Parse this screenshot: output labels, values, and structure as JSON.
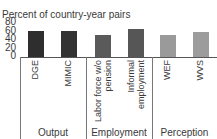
{
  "chart_data": {
    "type": "bar",
    "title": "Percent of country-year pairs",
    "xlabel": "",
    "ylabel": "Percent of country-year pairs",
    "ylim": [
      0,
      80
    ],
    "yticks": [
      "80",
      "60",
      "40",
      "20",
      "0"
    ],
    "grid": false,
    "legend": null,
    "categories": [
      "DGE",
      "MIMIC",
      "Labor force w/o pension",
      "Informal employment",
      "WEF",
      "WVS"
    ],
    "category_labels": [
      "DGE",
      "MIMIC",
      "Labor force w/o\npension",
      "Informal\nemployment",
      "WEF",
      "WVS"
    ],
    "values": [
      60,
      60,
      51,
      63,
      51,
      56
    ],
    "bar_colors": [
      "#2e2e2e",
      "#333333",
      "#5a5a5a",
      "#565656",
      "#9a9a9a",
      "#9c9c9c"
    ],
    "groups": [
      {
        "label": "Output",
        "categories": [
          "DGE",
          "MIMIC"
        ]
      },
      {
        "label": "Employment",
        "categories": [
          "Labor force w/o pension",
          "Informal employment"
        ]
      },
      {
        "label": "Perception",
        "categories": [
          "WEF",
          "WVS"
        ]
      }
    ]
  }
}
